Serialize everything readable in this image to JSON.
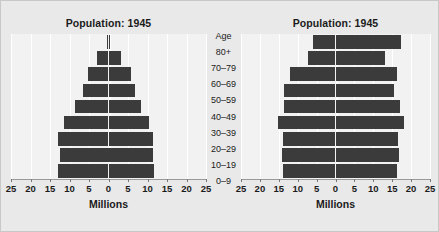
{
  "figure": {
    "background_color": "#e9e9e9",
    "panel_background_color": "#f2f2f2",
    "bar_color": "#3b3b3b",
    "gridline_color": "#ffffff"
  },
  "age_column": {
    "header": "Age",
    "labels": [
      "80+",
      "70–79",
      "60–69",
      "50–59",
      "40–49",
      "30–39",
      "20–29",
      "10–19",
      "0–9"
    ]
  },
  "chart_data": [
    {
      "type": "bar",
      "orientation": "population-pyramid",
      "title": "Population: 1945",
      "xlabel": "Millions",
      "ylabel": "Age",
      "xlim": [
        -25,
        25
      ],
      "xticks": [
        -25,
        -20,
        -15,
        -10,
        -5,
        0,
        5,
        10,
        15,
        20,
        25
      ],
      "xticklabels": [
        "25",
        "20",
        "15",
        "10",
        "5",
        "0",
        "5",
        "10",
        "15",
        "20",
        "25"
      ],
      "grid": true,
      "legend": "none",
      "categories": [
        "80+",
        "70–79",
        "60–69",
        "50–59",
        "40–49",
        "30–39",
        "20–29",
        "10–19",
        "0–9"
      ],
      "series": [
        {
          "name": "Male",
          "side": "left",
          "values": [
            0.4,
            3.0,
            5.3,
            6.6,
            8.6,
            11.4,
            12.9,
            12.5,
            13.0
          ]
        },
        {
          "name": "Female",
          "side": "right",
          "values": [
            0.4,
            3.3,
            5.7,
            6.9,
            8.3,
            10.3,
            11.5,
            11.4,
            11.6
          ]
        }
      ]
    },
    {
      "type": "bar",
      "orientation": "population-pyramid",
      "title": "Population: 1945",
      "xlabel": "Millions",
      "ylabel": "Age",
      "xlim": [
        -25,
        25
      ],
      "xticks": [
        -25,
        -20,
        -15,
        -10,
        -5,
        0,
        5,
        10,
        15,
        20,
        25
      ],
      "xticklabels": [
        "25",
        "20",
        "15",
        "10",
        "5",
        "0",
        "5",
        "10",
        "15",
        "20",
        "25"
      ],
      "grid": true,
      "legend": "none",
      "categories": [
        "80+",
        "70–79",
        "60–69",
        "50–59",
        "40–49",
        "30–39",
        "20–29",
        "10–19",
        "0–9"
      ],
      "series": [
        {
          "name": "Male",
          "side": "left",
          "values": [
            6.0,
            7.3,
            12.1,
            13.6,
            13.6,
            15.2,
            14.0,
            14.2,
            14.0
          ]
        },
        {
          "name": "Female",
          "side": "right",
          "values": [
            17.2,
            13.2,
            16.4,
            15.6,
            17.0,
            18.2,
            16.6,
            16.8,
            16.3
          ]
        }
      ]
    }
  ]
}
